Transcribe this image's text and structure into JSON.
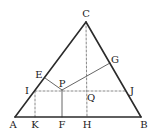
{
  "diagram": {
    "type": "geometry",
    "colors": {
      "solid_line": "#2b2b2b",
      "thin_line": "#555555",
      "dashed_line": "#888888",
      "label": "#222222"
    },
    "points": {
      "A": {
        "x": 15,
        "y": 117
      },
      "B": {
        "x": 141,
        "y": 117
      },
      "C": {
        "x": 86,
        "y": 22
      },
      "E": {
        "x": 45,
        "y": 78
      },
      "G": {
        "x": 110,
        "y": 63
      },
      "P": {
        "x": 62,
        "y": 90
      },
      "I": {
        "x": 35,
        "y": 91
      },
      "J": {
        "x": 127,
        "y": 91
      },
      "Q": {
        "x": 87,
        "y": 91
      },
      "K": {
        "x": 35,
        "y": 117
      },
      "F": {
        "x": 62,
        "y": 117
      },
      "H": {
        "x": 87,
        "y": 117
      }
    },
    "labels": [
      {
        "text": "C",
        "x": 86,
        "y": 14
      },
      {
        "text": "E",
        "x": 39,
        "y": 75
      },
      {
        "text": "G",
        "x": 115,
        "y": 60
      },
      {
        "text": "P",
        "x": 62,
        "y": 84
      },
      {
        "text": "I",
        "x": 27,
        "y": 91
      },
      {
        "text": "J",
        "x": 132,
        "y": 91
      },
      {
        "text": "Q",
        "x": 91,
        "y": 98
      },
      {
        "text": "A",
        "x": 13,
        "y": 125
      },
      {
        "text": "K",
        "x": 35,
        "y": 125
      },
      {
        "text": "F",
        "x": 62,
        "y": 125
      },
      {
        "text": "H",
        "x": 87,
        "y": 125
      },
      {
        "text": "B",
        "x": 144,
        "y": 125
      }
    ],
    "solid_segments": [
      {
        "from": "A",
        "to": "B"
      },
      {
        "from": "B",
        "to": "C"
      },
      {
        "from": "C",
        "to": "A"
      }
    ],
    "thin_segments": [
      {
        "from": "P",
        "to": "E"
      },
      {
        "from": "P",
        "to": "G"
      },
      {
        "from": "P",
        "to": "F"
      }
    ],
    "dashed_segments": [
      {
        "from": "I",
        "to": "J"
      },
      {
        "from": "C",
        "to": "H"
      },
      {
        "from": "I",
        "to": "K"
      }
    ]
  }
}
